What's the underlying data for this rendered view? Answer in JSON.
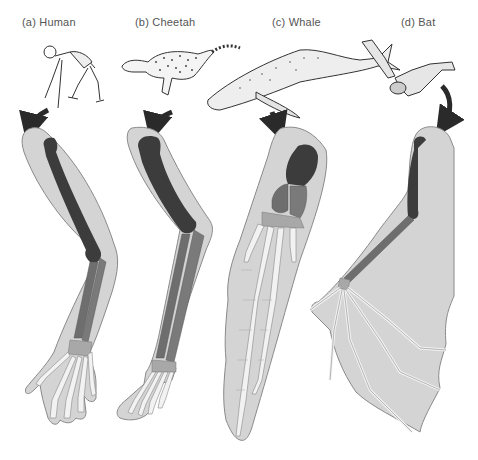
{
  "panels": [
    {
      "id": "a",
      "label": "(a) Human",
      "animal": "Human"
    },
    {
      "id": "b",
      "label": "(b) Cheetah",
      "animal": "Cheetah"
    },
    {
      "id": "c",
      "label": "(c) Whale",
      "animal": "Whale"
    },
    {
      "id": "d",
      "label": "(d) Bat",
      "animal": "Bat"
    }
  ],
  "colors": {
    "limb_outline_fill": "#d4d4d4",
    "limb_outline_stroke": "#8a8a8a",
    "humerus": "#3c3c3c",
    "radius_ulna": "#6e6e6e",
    "carpals": "#a8a8a8",
    "digits": "#f2f2f2",
    "arrow": "#2a2a2a"
  }
}
